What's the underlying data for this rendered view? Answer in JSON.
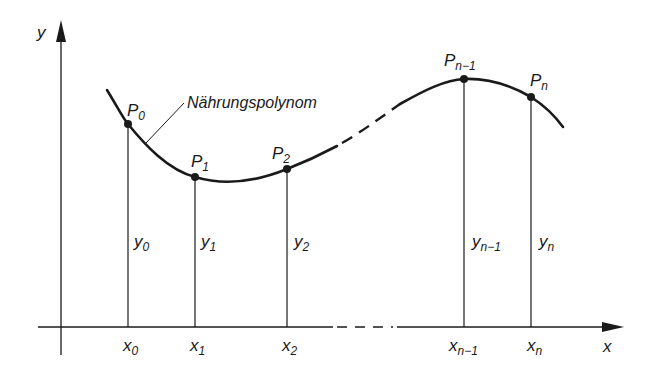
{
  "diagram": {
    "type": "polynomial-interpolation",
    "caption_label": "Nährungspolynom",
    "axes": {
      "x_label": "x",
      "y_label": "y"
    },
    "points": [
      {
        "name": "P",
        "sub": "0",
        "x_label": "x",
        "x_sub": "0",
        "y_label": "y",
        "y_sub": "0"
      },
      {
        "name": "P",
        "sub": "1",
        "x_label": "x",
        "x_sub": "1",
        "y_label": "y",
        "y_sub": "1"
      },
      {
        "name": "P",
        "sub": "2",
        "x_label": "x",
        "x_sub": "2",
        "y_label": "y",
        "y_sub": "2"
      },
      {
        "name": "P",
        "sub": "n−1",
        "x_label": "x",
        "x_sub": "n−1",
        "y_label": "y",
        "y_sub": "n−1"
      },
      {
        "name": "P",
        "sub": "n",
        "x_label": "x",
        "x_sub": "n",
        "y_label": "y",
        "y_sub": "n"
      }
    ],
    "colors": {
      "ink": "#1a1a1a",
      "background": "#ffffff"
    }
  }
}
